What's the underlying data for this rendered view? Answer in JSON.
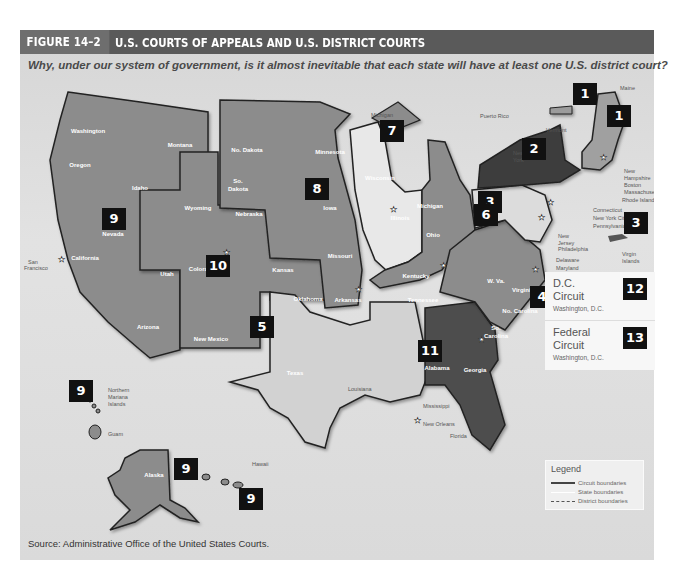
{
  "figure": {
    "number": "FIGURE 14–2",
    "title": "U.S. COURTS OF APPEALS AND U.S. DISTRICT COURTS",
    "question": "Why, under our system of government, is it almost inevitable that each state will have at least one U.S. district court?",
    "source": "Source: Administrative Office of the United States Courts."
  },
  "colors": {
    "title_bar": "#5a5a5a",
    "figure_number_bg": "#6e6e6e",
    "background": "#dcdcdc",
    "circuit_dark": "#4a4a4a",
    "circuit_medium": "#8a8a8a",
    "circuit_light": "#c8c8c8",
    "badge": "#111111"
  },
  "circuits": [
    {
      "number": "1",
      "states": [
        "Maine",
        "New Hampshire",
        "Massachusetts",
        "Rhode Island",
        "Puerto Rico"
      ],
      "seat": "Boston"
    },
    {
      "number": "2",
      "states": [
        "Vermont",
        "New York",
        "Connecticut"
      ],
      "seat": "New York City"
    },
    {
      "number": "3",
      "states": [
        "Pennsylvania",
        "New Jersey",
        "Delaware",
        "Virgin Islands"
      ],
      "seat": "Philadelphia"
    },
    {
      "number": "4",
      "states": [
        "Maryland",
        "W. Va.",
        "Virginia",
        "No. Carolina",
        "So. Carolina"
      ],
      "seat": "Richmond"
    },
    {
      "number": "5",
      "states": [
        "Texas",
        "Louisiana",
        "Mississippi"
      ],
      "seat": "New Orleans"
    },
    {
      "number": "6",
      "states": [
        "Michigan",
        "Ohio",
        "Kentucky",
        "Tennessee"
      ],
      "seat": "Cincinnati"
    },
    {
      "number": "7",
      "states": [
        "Wisconsin",
        "Illinois",
        "Indiana"
      ],
      "seat": "Chicago"
    },
    {
      "number": "8",
      "states": [
        "No. Dakota",
        "So. Dakota",
        "Nebraska",
        "Minnesota",
        "Iowa",
        "Missouri",
        "Arkansas"
      ],
      "seat": "St. Louis"
    },
    {
      "number": "9",
      "states": [
        "Washington",
        "Oregon",
        "California",
        "Nevada",
        "Idaho",
        "Montana",
        "Arizona",
        "Alaska",
        "Hawaii",
        "Guam",
        "Northern Mariana Islands"
      ],
      "seat": "San Francisco"
    },
    {
      "number": "10",
      "states": [
        "Wyoming",
        "Utah",
        "Colorado",
        "Kansas",
        "Oklahoma",
        "New Mexico"
      ],
      "seat": "Denver"
    },
    {
      "number": "11",
      "states": [
        "Alabama",
        "Georgia",
        "Florida"
      ],
      "seat": "Atlanta"
    }
  ],
  "special_circuits": [
    {
      "name": "D.C. Circuit",
      "line1": "D.C.",
      "line2": "Circuit",
      "location": "Washington, D.C.",
      "number": "12"
    },
    {
      "name": "Federal Circuit",
      "line1": "Federal",
      "line2": "Circuit",
      "location": "Washington, D.C.",
      "number": "13"
    }
  ],
  "map_labels": {
    "washington": "Washington",
    "oregon": "Oregon",
    "california": "California",
    "nevada": "Nevada",
    "idaho": "Idaho",
    "montana": "Montana",
    "wyoming": "Wyoming",
    "utah": "Utah",
    "colorado": "Colorado",
    "arizona": "Arizona",
    "new_mexico": "New Mexico",
    "no_dakota": "No. Dakota",
    "so_dakota_1": "So.",
    "so_dakota_2": "Dakota",
    "nebraska": "Nebraska",
    "kansas": "Kansas",
    "oklahoma": "Oklahoma",
    "texas": "Texas",
    "minnesota": "Minnesota",
    "iowa": "Iowa",
    "missouri": "Missouri",
    "arkansas": "Arkansas",
    "louisiana": "Louisiana",
    "mississippi": "Mississippi",
    "wisconsin": "Wisconsin",
    "illinois": "Illinois",
    "indiana": "Indiana",
    "michigan_upper": "Michigan",
    "michigan": "Michigan",
    "ohio": "Ohio",
    "kentucky": "Kentucky",
    "tennessee": "Tennessee",
    "alabama": "Alabama",
    "georgia": "Georgia",
    "florida": "Florida",
    "wva": "W. Va.",
    "virginia": "Virginia",
    "no_carolina": "No. Carolina",
    "so_carolina_1": "So.",
    "so_carolina_2": "Carolina",
    "pennsylvania": "Pennsylvania",
    "new_york_1": "New",
    "new_york_2": "York",
    "vermont": "Vermont",
    "maine": "Maine",
    "new_hampshire_1": "New",
    "new_hampshire_2": "Hampshire",
    "massachusetts": "Massachusetts",
    "rhode_island": "Rhode Island",
    "connecticut": "Connecticut",
    "new_jersey_1": "New",
    "new_jersey_2": "Jersey",
    "delaware": "Delaware",
    "maryland": "Maryland",
    "district_of_columbia": "District of Columbia",
    "puerto_rico": "Puerto Rico",
    "virgin_islands_1": "Virgin",
    "virgin_islands_2": "Islands",
    "alaska": "Alaska",
    "hawaii": "Hawaii",
    "guam": "Guam",
    "nmi_1": "Northern",
    "nmi_2": "Mariana",
    "nmi_3": "Islands",
    "san_francisco_1": "San",
    "san_francisco_2": "Francisco",
    "denver": "Denver",
    "st_louis": "St. Louis",
    "chicago": "Chicago",
    "cincinnati": "Cincinnati",
    "atlanta": "Atlanta",
    "new_orleans": "New Orleans",
    "boston": "Boston",
    "new_york_city": "New York City",
    "philadelphia": "Philadelphia",
    "washington_dc": "Washington, D.C.",
    "richmond": "Richmond"
  },
  "legend": {
    "title": "Legend",
    "items": [
      {
        "label": "Circuit boundaries",
        "style": "solid-dark"
      },
      {
        "label": "State boundaries",
        "style": "solid-white"
      },
      {
        "label": "District boundaries",
        "style": "dashed"
      }
    ]
  }
}
